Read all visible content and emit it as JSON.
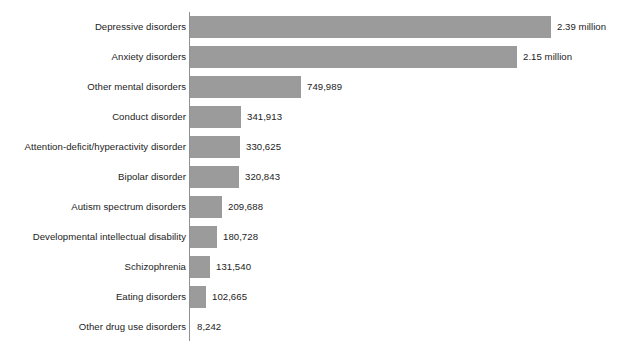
{
  "clipped_header_text": "",
  "style": {
    "bar_color": "#9b9b9b",
    "axis_color": "#8e9196",
    "text_color": "#1c1c1c",
    "background": "#ffffff"
  },
  "chart_data": {
    "type": "bar",
    "orientation": "horizontal",
    "title": "",
    "subtitle": "",
    "xlabel": "",
    "ylabel": "",
    "grid": false,
    "legend": null,
    "axis_visible": true,
    "xlim": [
      0,
      2390000
    ],
    "categories": [
      "Depressive disorders",
      "Anxiety disorders",
      "Other mental disorders",
      "Conduct disorder",
      "Attention-deficit/hyperactivity disorder",
      "Bipolar disorder",
      "Autism spectrum disorders",
      "Developmental intellectual disability",
      "Schizophrenia",
      "Eating disorders",
      "Other drug use disorders"
    ],
    "values": [
      2390000,
      2150000,
      749989,
      341913,
      330625,
      320843,
      209688,
      180728,
      131540,
      102665,
      8242
    ],
    "value_labels": [
      "2.39 million",
      "2.15 million",
      "749,989",
      "341,913",
      "330,625",
      "320,843",
      "209,688",
      "180,728",
      "131,540",
      "102,665",
      "8,242"
    ]
  },
  "rows": [
    {
      "label": "Depressive disorders",
      "value_label": "2.39 million",
      "bar_px": 361
    },
    {
      "label": "Anxiety disorders",
      "value_label": "2.15 million",
      "bar_px": 327
    },
    {
      "label": "Other mental disorders",
      "value_label": "749,989",
      "bar_px": 111
    },
    {
      "label": "Conduct disorder",
      "value_label": "341,913",
      "bar_px": 51
    },
    {
      "label": "Attention-deficit/hyperactivity disorder",
      "value_label": "330,625",
      "bar_px": 50
    },
    {
      "label": "Bipolar disorder",
      "value_label": "320,843",
      "bar_px": 49
    },
    {
      "label": "Autism spectrum disorders",
      "value_label": "209,688",
      "bar_px": 32
    },
    {
      "label": "Developmental intellectual disability",
      "value_label": "180,728",
      "bar_px": 27
    },
    {
      "label": "Schizophrenia",
      "value_label": "131,540",
      "bar_px": 20
    },
    {
      "label": "Eating disorders",
      "value_label": "102,665",
      "bar_px": 16
    },
    {
      "label": "Other drug use disorders",
      "value_label": "8,242",
      "bar_px": 1
    }
  ]
}
